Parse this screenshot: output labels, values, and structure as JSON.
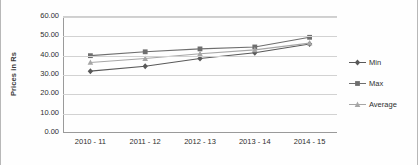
{
  "chart_data": {
    "type": "line",
    "title": "",
    "xlabel": "",
    "ylabel": "Prices in Rs",
    "categories": [
      "2010 - 11",
      "2011 - 12",
      "2012 - 13",
      "2013 - 14",
      "2014 - 15"
    ],
    "series": [
      {
        "name": "Min",
        "values": [
          32.0,
          34.5,
          38.5,
          41.5,
          46.0
        ],
        "color": "#595959",
        "marker": "diamond"
      },
      {
        "name": "Max",
        "values": [
          40.0,
          42.0,
          43.5,
          44.5,
          49.5
        ],
        "color": "#6e6e6e",
        "marker": "square"
      },
      {
        "name": "Average",
        "values": [
          36.5,
          38.5,
          41.0,
          43.0,
          46.5
        ],
        "color": "#a6a6a6",
        "marker": "triangle"
      }
    ],
    "ylim": [
      0,
      60
    ],
    "y_ticks": [
      "0.00",
      "10.00",
      "20.00",
      "30.00",
      "40.00",
      "50.00",
      "60.00"
    ],
    "y_tick_values": [
      0,
      10,
      20,
      30,
      40,
      50,
      60
    ],
    "grid": true,
    "legend_position": "right"
  },
  "legend": {
    "entries": [
      {
        "label": "Min"
      },
      {
        "label": "Max"
      },
      {
        "label": "Average"
      }
    ]
  }
}
